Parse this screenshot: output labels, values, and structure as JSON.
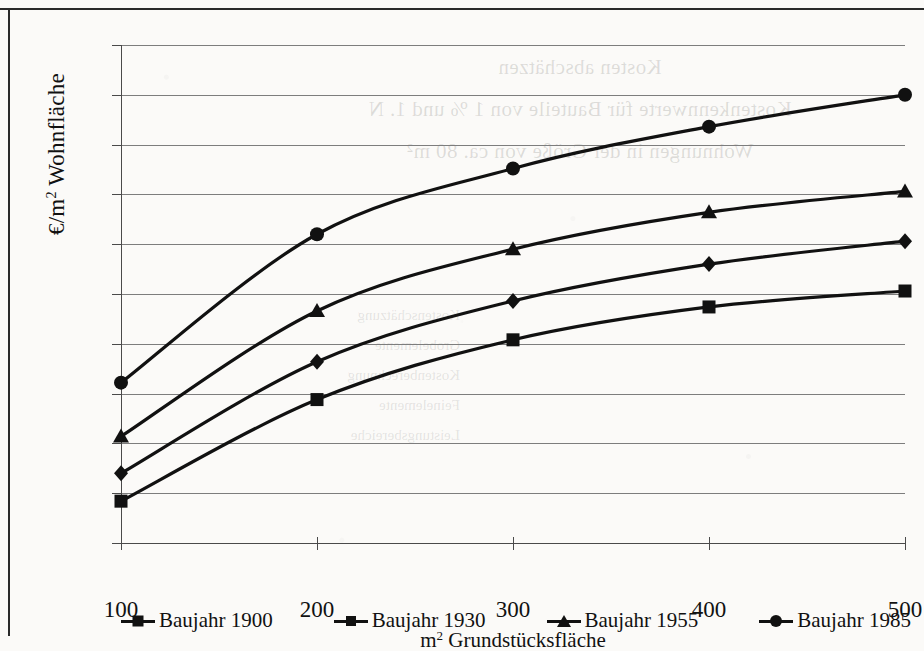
{
  "chart_data": {
    "type": "line",
    "title": "",
    "xlabel": "m² Grundstücksfläche",
    "ylabel": "€/m² Wohnfläche",
    "x": [
      100,
      200,
      300,
      400,
      500
    ],
    "xticklabels": [
      "100",
      "200",
      "300",
      "400",
      "500"
    ],
    "yticklabels": [
      "3 000",
      "2 750",
      "2 500",
      "2 250",
      "2 000",
      "1 750",
      "1 500",
      "1 250",
      "1 000",
      "750",
      "500"
    ],
    "ytickvalues": [
      3000,
      2750,
      2500,
      2250,
      2000,
      1750,
      1500,
      1250,
      1000,
      750,
      500
    ],
    "xlim": [
      100,
      500
    ],
    "ylim": [
      500,
      3000
    ],
    "grid": "horizontal",
    "legend_position": "bottom",
    "series": [
      {
        "name": "Baujahr 1900",
        "marker": "square",
        "values": [
          710,
          1220,
          1520,
          1685,
          1765
        ]
      },
      {
        "name": "Baujahr 1930",
        "marker": "diamond",
        "values": [
          850,
          1410,
          1715,
          1900,
          2015
        ]
      },
      {
        "name": "Baujahr 1955",
        "marker": "triangle",
        "values": [
          1035,
          1665,
          1975,
          2160,
          2265
        ]
      },
      {
        "name": "Baujahr 1985",
        "marker": "circle",
        "values": [
          1305,
          2050,
          2380,
          2590,
          2750
        ]
      }
    ]
  },
  "legend": {
    "items": [
      {
        "label": "Baujahr 1900",
        "marker": "square"
      },
      {
        "label": "Baujahr 1930",
        "marker": "diamond"
      },
      {
        "label": "Baujahr 1955",
        "marker": "triangle"
      },
      {
        "label": "Baujahr 1985",
        "marker": "circle"
      }
    ]
  },
  "axis_titles": {
    "y_prefix": "€/m",
    "y_sup": "2",
    "y_suffix": " Wohnfläche",
    "x_prefix": "m",
    "x_sup": "2",
    "x_suffix": " Grundstücksfläche"
  },
  "bleed_through": {
    "line1": "Kosten abschätzen",
    "line2": "Kostenkennwerte für Bauteile von 1 % und 1. N",
    "line3": "Wohnungen in der Größe von ca. 80 m²",
    "block": "Kostenschätzung\nGrobelemente\nKostenberechnung\nFeinelemente\nLeistungsbereiche"
  },
  "colors": {
    "ink": "#111111",
    "grid": "#7d7d7d",
    "axis": "#4a4a4a",
    "paper": "#fbfaf8"
  }
}
